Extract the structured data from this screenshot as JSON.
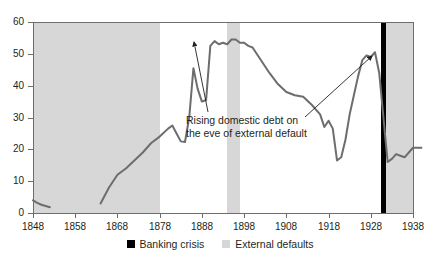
{
  "chart_data": {
    "type": "line",
    "title": "",
    "xlabel": "",
    "ylabel": "",
    "xlim": [
      1848,
      1940
    ],
    "ylim": [
      0,
      60
    ],
    "yticks": [
      0,
      10,
      20,
      30,
      40,
      50,
      60
    ],
    "xticks": [
      1848,
      1858,
      1868,
      1878,
      1888,
      1898,
      1908,
      1918,
      1928,
      1938
    ],
    "grid": false,
    "legend_position": "bottom-center",
    "line_color": "#6d6d6d",
    "series": [
      {
        "name": "Domestic debt share",
        "x": [
          1848,
          1849,
          1850,
          1851,
          1852,
          1864,
          1866,
          1868,
          1870,
          1872,
          1874,
          1876,
          1878,
          1880,
          1881,
          1882,
          1883,
          1884,
          1885,
          1886,
          1887,
          1888,
          1889,
          1890,
          1891,
          1892,
          1893,
          1894,
          1895,
          1896,
          1897,
          1898,
          1899,
          1900,
          1902,
          1904,
          1906,
          1908,
          1910,
          1912,
          1914,
          1916,
          1917,
          1918,
          1919,
          1920,
          1921,
          1922,
          1923,
          1924,
          1925,
          1926,
          1927,
          1928,
          1929,
          1930,
          1931,
          1932,
          1933,
          1934,
          1935,
          1936,
          1938,
          1940
        ],
        "y": [
          4.0,
          3.2,
          2.6,
          2.2,
          1.8,
          3.0,
          8.0,
          12.0,
          14.0,
          16.5,
          19.0,
          22.0,
          24.0,
          26.5,
          27.5,
          25.0,
          22.5,
          22.3,
          30.0,
          45.5,
          39.0,
          35.0,
          35.5,
          52.5,
          54.0,
          53.0,
          53.5,
          53.0,
          54.5,
          54.5,
          53.5,
          53.5,
          52.5,
          52.0,
          48.0,
          44.0,
          40.5,
          38.0,
          37.0,
          36.5,
          34.0,
          31.0,
          27.0,
          29.0,
          26.5,
          16.5,
          17.5,
          23.0,
          31.0,
          37.0,
          43.0,
          48.0,
          49.5,
          49.0,
          50.5,
          44.0,
          30.0,
          16.0,
          17.0,
          18.5,
          18.0,
          17.5,
          20.5,
          20.5
        ]
      }
    ],
    "segments_note": "data gap between 1852 and 1864",
    "shaded_bands": [
      {
        "label": "External defaults",
        "start": 1848,
        "end": 1878,
        "color": "#d7d7d7"
      },
      {
        "label": "External defaults",
        "start": 1894,
        "end": 1897,
        "color": "#d7d7d7"
      },
      {
        "label": "External defaults",
        "start": 1931,
        "end": 1940,
        "color": "#d7d7d7"
      }
    ],
    "event_markers": [
      {
        "label": "Banking crisis",
        "year": 1931,
        "color": "#000000"
      }
    ],
    "annotations": [
      {
        "text_line1": "Rising domestic debt on",
        "text_line2": "the eve of external default",
        "points_to": [
          [
            1886,
            53.5
          ],
          [
            1929,
            50.5
          ]
        ]
      }
    ],
    "legend": [
      {
        "label": "Banking crisis",
        "color": "#000000"
      },
      {
        "label": "External defaults",
        "color": "#d7d7d7"
      }
    ]
  },
  "axis": {
    "y_labels": [
      "60",
      "50",
      "40",
      "30",
      "20",
      "10",
      "0"
    ],
    "x_labels": [
      "1848",
      "1858",
      "1868",
      "1878",
      "1888",
      "1898",
      "1908",
      "1918",
      "1928",
      "1938"
    ]
  },
  "annotation": {
    "line1": "Rising domestic debt on",
    "line2": "the eve of external default"
  },
  "legend": {
    "banking_crisis": "Banking crisis",
    "external_defaults": "External defaults"
  }
}
